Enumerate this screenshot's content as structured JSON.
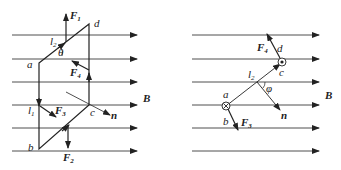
{
  "left_figure": {
    "vertex_labels": {
      "a": "a",
      "b": "b",
      "c": "c",
      "d": "d"
    },
    "segment_labels": {
      "l1": "l",
      "l1_sub": "1",
      "l2": "l",
      "l2_sub": "2"
    },
    "angle_label": "θ",
    "normal_label": "n",
    "field_label": "B",
    "forces": [
      {
        "name": "F",
        "sub": "1"
      },
      {
        "name": "F",
        "sub": "2"
      },
      {
        "name": "F",
        "sub": "3"
      },
      {
        "name": "F",
        "sub": "4"
      }
    ]
  },
  "right_figure": {
    "vertex_labels": {
      "a": "a",
      "b": "b",
      "c": "c",
      "d": "d"
    },
    "segment_label": "l",
    "segment_sub": "2",
    "angle_label": "φ",
    "normal_label": "n",
    "field_label": "B",
    "forces": [
      {
        "name": "F",
        "sub": "3"
      },
      {
        "name": "F",
        "sub": "4"
      }
    ]
  },
  "colors": {
    "ink": "#222222",
    "background": "#ffffff"
  }
}
